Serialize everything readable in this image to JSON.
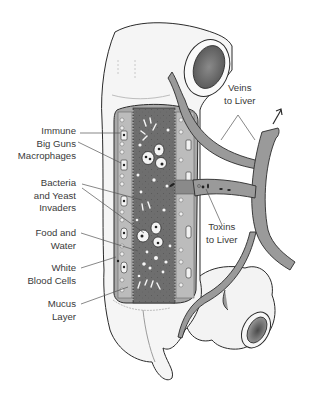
{
  "diagram": {
    "colors": {
      "background": "#ffffff",
      "outline": "#2b2b2b",
      "tissue": "#f4f4f4",
      "lumen": "#6e6e6e",
      "wall": "#a9a9a9",
      "vein": "#9a9a9a",
      "text": "#3a3a3a"
    },
    "labels_left": [
      {
        "id": "immune",
        "lines": [
          "Immune",
          "Big Guns",
          "Macrophages"
        ]
      },
      {
        "id": "bacteria",
        "lines": [
          "Bacteria",
          "and Yeast",
          "Invaders"
        ]
      },
      {
        "id": "food",
        "lines": [
          "Food and",
          "Water"
        ]
      },
      {
        "id": "wbc",
        "lines": [
          "White",
          "Blood Cells"
        ]
      },
      {
        "id": "mucus",
        "lines": [
          "Mucus",
          "Layer"
        ]
      }
    ],
    "labels_right": [
      {
        "id": "veins",
        "lines": [
          "Veins",
          "to Liver"
        ]
      },
      {
        "id": "toxins",
        "lines": [
          "Toxins",
          "to Liver"
        ]
      }
    ],
    "arrow": {
      "direction": "up-right",
      "icon": "arrow-up-right-icon"
    }
  }
}
